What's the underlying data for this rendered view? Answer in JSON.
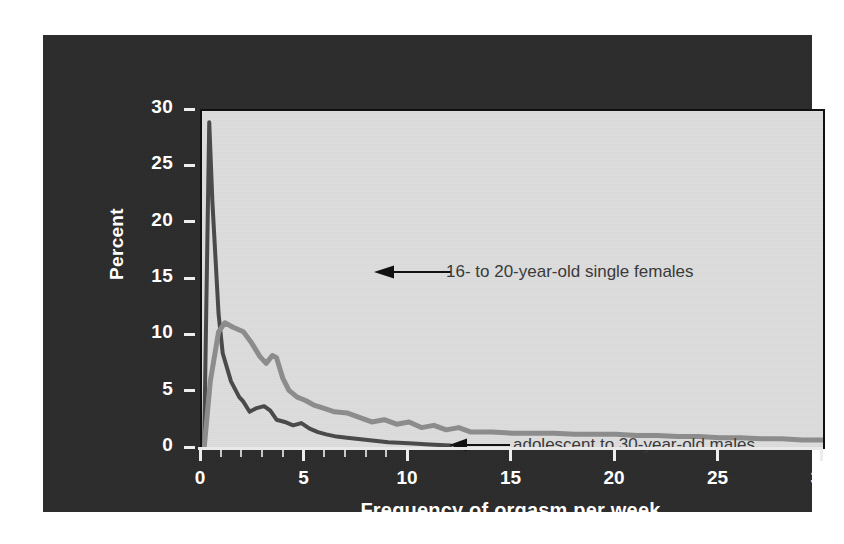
{
  "figure": {
    "background": "#ffffff",
    "panel_color": "#2b2b2b",
    "plot_background": "#dcdcdc"
  },
  "chart_data": {
    "type": "line",
    "title": "",
    "xlabel": "Frequency of orgasm per week",
    "ylabel": "Percent",
    "xlim": [
      0,
      30
    ],
    "ylim": [
      0,
      30
    ],
    "grid": false,
    "legend_position": "inline-annotations",
    "xticks": [
      0,
      5,
      10,
      15,
      20,
      25,
      30
    ],
    "xtick_labels": [
      "0",
      "5",
      "10",
      "15",
      "20",
      "25",
      "30"
    ],
    "xticks_minor": [
      1,
      2,
      3,
      4,
      6,
      7,
      8,
      9
    ],
    "yticks": [
      0,
      5,
      10,
      15,
      20,
      25,
      30
    ],
    "ytick_labels": [
      "0",
      "5",
      "10",
      "15",
      "20",
      "25",
      "30"
    ],
    "series": [
      {
        "name": "16- to 20-year-old single females",
        "color": "#4a4a4a",
        "linewidth": 4,
        "x": [
          0.1,
          0.35,
          0.5,
          0.8,
          1.0,
          1.4,
          1.8,
          2.0,
          2.3,
          2.6,
          3.0,
          3.3,
          3.6,
          4.0,
          4.4,
          4.8,
          5.2,
          5.6,
          6.0,
          6.5,
          7.0,
          8.0,
          9.0,
          10.0,
          11.0,
          12.0
        ],
        "y": [
          0.0,
          29.0,
          22.0,
          12.0,
          8.5,
          6.0,
          4.6,
          4.2,
          3.3,
          3.6,
          3.8,
          3.4,
          2.6,
          2.4,
          2.1,
          2.3,
          1.8,
          1.5,
          1.3,
          1.1,
          1.0,
          0.8,
          0.6,
          0.5,
          0.4,
          0.3
        ]
      },
      {
        "name": "adolescent to 30-year-old males",
        "color": "#8c8c8c",
        "linewidth": 5,
        "x": [
          0.1,
          0.4,
          0.8,
          1.1,
          1.5,
          2.0,
          2.4,
          2.8,
          3.1,
          3.4,
          3.6,
          3.9,
          4.2,
          4.6,
          5.0,
          5.4,
          5.9,
          6.4,
          7.0,
          7.6,
          8.2,
          8.8,
          9.4,
          10.0,
          10.6,
          11.2,
          11.8,
          12.4,
          13.0,
          14.0,
          15.0,
          16.0,
          17.0,
          18.0,
          19.0,
          20.0,
          21.0,
          22.0,
          23.0,
          24.0,
          25.0,
          26.0,
          27.0,
          28.0,
          29.0,
          30.0
        ],
        "y": [
          0.0,
          6.0,
          10.4,
          11.2,
          10.8,
          10.4,
          9.4,
          8.2,
          7.6,
          8.3,
          8.1,
          6.3,
          5.2,
          4.6,
          4.3,
          3.9,
          3.6,
          3.3,
          3.2,
          2.8,
          2.4,
          2.6,
          2.2,
          2.4,
          1.9,
          2.1,
          1.7,
          1.9,
          1.5,
          1.5,
          1.4,
          1.4,
          1.4,
          1.3,
          1.3,
          1.3,
          1.2,
          1.2,
          1.1,
          1.1,
          1.0,
          1.0,
          0.9,
          0.9,
          0.8,
          0.8
        ]
      }
    ],
    "annotations": [
      {
        "name": "females-annotation",
        "text": "16- to 20-year-old single females",
        "points_to_series": "16- to 20-year-old single females"
      },
      {
        "name": "males-annotation",
        "text": "adolescent to 30-year-old males",
        "points_to_series": "adolescent to 30-year-old males"
      }
    ]
  }
}
